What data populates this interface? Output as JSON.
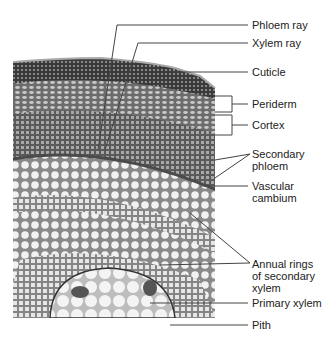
{
  "figure": {
    "labels": [
      {
        "id": "phloem-ray",
        "text": "Phloem ray"
      },
      {
        "id": "xylem-ray",
        "text": "Xylem ray"
      },
      {
        "id": "cuticle",
        "text": "Cuticle"
      },
      {
        "id": "periderm",
        "text": "Periderm"
      },
      {
        "id": "cortex",
        "text": "Cortex"
      },
      {
        "id": "secondary-phloem",
        "text": "Secondary phloem",
        "lines": [
          "Secondary",
          "phloem"
        ]
      },
      {
        "id": "vascular-cambium",
        "text": "Vascular cambium",
        "lines": [
          "Vascular",
          "cambium"
        ]
      },
      {
        "id": "annual-rings",
        "text": "Annual rings of secondary xylem",
        "lines": [
          "Annual rings",
          "of secondary",
          "xylem"
        ]
      },
      {
        "id": "primary-xylem",
        "text": "Primary xylem"
      },
      {
        "id": "pith",
        "text": "Pith"
      }
    ]
  },
  "colors": {
    "leader": "#444444",
    "text": "#222222"
  }
}
